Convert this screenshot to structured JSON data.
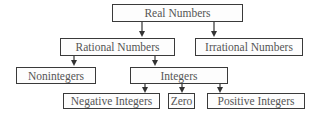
{
  "diagram": {
    "type": "hierarchy",
    "nodes": [
      {
        "id": "real",
        "label": "Real Numbers"
      },
      {
        "id": "rational",
        "label": "Rational Numbers"
      },
      {
        "id": "irrational",
        "label": "Irrational Numbers"
      },
      {
        "id": "nonintegers",
        "label": "Nonintegers"
      },
      {
        "id": "integers",
        "label": "Integers"
      },
      {
        "id": "negative",
        "label": "Negative Integers"
      },
      {
        "id": "zero",
        "label": "Zero"
      },
      {
        "id": "positive",
        "label": "Positive Integers"
      }
    ],
    "edges": [
      {
        "from": "real",
        "to": "rational"
      },
      {
        "from": "real",
        "to": "irrational"
      },
      {
        "from": "rational",
        "to": "nonintegers"
      },
      {
        "from": "rational",
        "to": "integers"
      },
      {
        "from": "integers",
        "to": "negative"
      },
      {
        "from": "integers",
        "to": "zero"
      },
      {
        "from": "integers",
        "to": "positive"
      }
    ],
    "colors": {
      "border": "#3a3a3a",
      "text": "#555555",
      "arrow": "#333333"
    }
  }
}
